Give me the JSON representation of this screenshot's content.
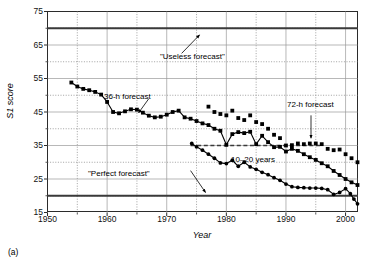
{
  "caption": "(a)",
  "axes": {
    "ylabel": "S1 score",
    "xlabel": "Year",
    "yticks": [
      75,
      65,
      55,
      45,
      35,
      25,
      15
    ],
    "xticks": [
      1950,
      1960,
      1970,
      1980,
      1990,
      2000
    ]
  },
  "annotations": {
    "useless": "\"Useless forecast\"",
    "perfect": "\"Perfect forecast\"",
    "f36": "36-h forecast",
    "f72": "72-h forecast",
    "span": "10–20 years"
  },
  "chart_data": {
    "type": "line",
    "title": "",
    "xlabel": "Year",
    "ylabel": "S1 score",
    "xlim": [
      1950,
      2002
    ],
    "ylim": [
      15,
      75
    ],
    "grid": true,
    "legend": "none",
    "ymajor": [
      15,
      25,
      35,
      45,
      55,
      65,
      75
    ],
    "yminor": [
      20,
      30,
      40,
      50,
      60,
      70
    ],
    "xmajor": [
      1950,
      1960,
      1970,
      1980,
      1990,
      2000
    ],
    "xminor": [
      1955,
      1965,
      1975,
      1985,
      1995
    ],
    "reference_lines": [
      {
        "name": "Useless forecast",
        "y": 70,
        "style": "solid",
        "width": 2
      },
      {
        "name": "Perfect forecast",
        "y": 20,
        "style": "solid",
        "width": 2
      },
      {
        "name": "10-20 years",
        "y": 35,
        "style": "dashed",
        "width": 1.6,
        "x_start": 1974,
        "x_end": 1996
      }
    ],
    "series": [
      {
        "name": "36-h forecast",
        "marker": "filled-square",
        "line": true,
        "points": [
          [
            1954.0,
            53.8
          ],
          [
            1955.0,
            52.6
          ],
          [
            1956.0,
            51.9
          ],
          [
            1957.0,
            51.5
          ],
          [
            1958.0,
            51.0
          ],
          [
            1959.0,
            50.2
          ],
          [
            1960.0,
            48.0
          ],
          [
            1961.0,
            45.0
          ],
          [
            1962.0,
            44.6
          ],
          [
            1963.0,
            45.2
          ],
          [
            1964.0,
            45.8
          ],
          [
            1965.0,
            45.7
          ],
          [
            1966.0,
            44.8
          ],
          [
            1967.0,
            43.9
          ],
          [
            1968.0,
            43.4
          ],
          [
            1969.0,
            43.6
          ],
          [
            1970.0,
            44.2
          ],
          [
            1971.0,
            45.0
          ],
          [
            1972.0,
            45.4
          ],
          [
            1973.0,
            43.4
          ],
          [
            1974.0,
            43.0
          ],
          [
            1975.0,
            42.3
          ],
          [
            1976.0,
            41.6
          ],
          [
            1977.0,
            41.1
          ],
          [
            1978.0,
            40.0
          ],
          [
            1979.0,
            39.4
          ],
          [
            1980.0,
            35.2
          ],
          [
            1981.0,
            38.4
          ],
          [
            1982.0,
            39.0
          ],
          [
            1983.0,
            38.7
          ],
          [
            1984.0,
            39.1
          ],
          [
            1985.0,
            35.4
          ],
          [
            1986.0,
            37.9
          ],
          [
            1987.0,
            36.0
          ],
          [
            1988.0,
            34.5
          ],
          [
            1989.0,
            34.6
          ],
          [
            1990.0,
            33.2
          ],
          [
            1991.0,
            34.0
          ],
          [
            1992.0,
            33.4
          ],
          [
            1993.0,
            32.4
          ],
          [
            1994.0,
            31.5
          ],
          [
            1995.0,
            30.7
          ],
          [
            1996.0,
            29.7
          ],
          [
            1997.0,
            28.8
          ],
          [
            1998.0,
            27.4
          ],
          [
            1999.0,
            26.2
          ],
          [
            2000.0,
            25.0
          ],
          [
            2001.0,
            24.0
          ],
          [
            2002.0,
            23.2
          ]
        ]
      },
      {
        "name": "lower declining curve",
        "marker": "filled-circle",
        "line": true,
        "points": [
          [
            1974.2,
            35.6
          ],
          [
            1975.0,
            34.6
          ],
          [
            1976.0,
            33.6
          ],
          [
            1977.0,
            32.4
          ],
          [
            1978.0,
            31.2
          ],
          [
            1979.0,
            29.8
          ],
          [
            1980.0,
            29.6
          ],
          [
            1981.0,
            30.6
          ],
          [
            1982.0,
            28.8
          ],
          [
            1983.0,
            30.0
          ],
          [
            1984.0,
            28.6
          ],
          [
            1985.0,
            27.9
          ],
          [
            1986.0,
            27.0
          ],
          [
            1987.0,
            26.3
          ],
          [
            1988.0,
            25.4
          ],
          [
            1989.0,
            24.6
          ],
          [
            1990.0,
            23.5
          ],
          [
            1991.0,
            22.7
          ],
          [
            1992.0,
            22.5
          ],
          [
            1993.0,
            22.4
          ],
          [
            1994.0,
            22.3
          ],
          [
            1995.0,
            22.3
          ],
          [
            1996.0,
            22.2
          ],
          [
            1997.0,
            21.8
          ],
          [
            1998.0,
            20.4
          ],
          [
            1999.0,
            21.0
          ],
          [
            2000.0,
            22.1
          ],
          [
            2000.8,
            20.6
          ],
          [
            2001.4,
            19.0
          ],
          [
            2002.0,
            17.6
          ]
        ]
      },
      {
        "name": "72-h forecast",
        "marker": "filled-square",
        "line": false,
        "points": [
          [
            1977.0,
            46.6
          ],
          [
            1978.0,
            45.0
          ],
          [
            1979.0,
            44.4
          ],
          [
            1980.0,
            44.0
          ],
          [
            1981.0,
            45.4
          ],
          [
            1982.0,
            43.2
          ],
          [
            1983.0,
            42.6
          ],
          [
            1984.0,
            44.0
          ],
          [
            1985.0,
            42.0
          ],
          [
            1986.0,
            41.4
          ],
          [
            1987.0,
            40.0
          ],
          [
            1988.0,
            38.2
          ],
          [
            1989.0,
            37.2
          ],
          [
            1990.0,
            35.0
          ],
          [
            1991.0,
            35.1
          ],
          [
            1992.0,
            35.6
          ],
          [
            1993.0,
            35.4
          ],
          [
            1994.0,
            35.6
          ],
          [
            1995.0,
            35.6
          ],
          [
            1996.0,
            35.4
          ],
          [
            1997.0,
            34.0
          ],
          [
            1998.0,
            33.6
          ],
          [
            1999.0,
            33.8
          ],
          [
            2000.0,
            32.4
          ],
          [
            2001.0,
            31.2
          ],
          [
            2002.0,
            30.0
          ]
        ]
      }
    ],
    "callouts": [
      {
        "label": "\"Useless forecast\"",
        "from": [
          1972.5,
          62.5
        ],
        "to": [
          1975.5,
          68.0
        ]
      },
      {
        "label": "\"Perfect forecast\"",
        "from": [
          1974.0,
          27.5
        ],
        "to": [
          1976.5,
          21.0
        ]
      },
      {
        "label": "36-h forecast",
        "from": [
          1967.0,
          49.0
        ],
        "to": [
          1965.3,
          44.8
        ]
      },
      {
        "label": "72-h forecast",
        "from": [
          1994.2,
          44.0
        ],
        "to": [
          1994.2,
          37.2
        ]
      }
    ]
  }
}
